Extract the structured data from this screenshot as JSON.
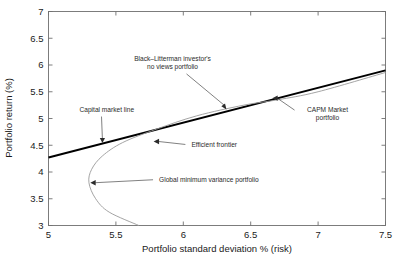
{
  "chart_data": {
    "type": "line",
    "title": "",
    "xlabel": "Portfolio standard deviation % (risk)",
    "ylabel": "Portfolio return (%)",
    "xlim": [
      5,
      7.5
    ],
    "ylim": [
      3,
      7
    ],
    "grid": false,
    "legend": "none",
    "xticks": [
      "5",
      "5.5",
      "6",
      "6.5",
      "7",
      "7.5"
    ],
    "xtick_values": [
      5,
      5.5,
      6,
      6.5,
      7,
      7.5
    ],
    "yticks": [
      "3",
      "3.5",
      "4",
      "4.5",
      "5",
      "5.5",
      "6",
      "6.5",
      "7"
    ],
    "ytick_values": [
      3,
      3.5,
      4,
      4.5,
      5,
      5.5,
      6,
      6.5,
      7
    ],
    "series": [
      {
        "name": "Capital market line",
        "style": "thick-black-straight",
        "color": "#000000",
        "x": [
          5.0,
          7.5
        ],
        "y": [
          4.27,
          5.9
        ]
      },
      {
        "name": "Efficient frontier",
        "style": "thin-gray-hyperbola",
        "color": "#9a9a9a",
        "x": [
          5.67,
          5.45,
          5.35,
          5.3,
          5.32,
          5.4,
          5.55,
          5.8,
          6.1,
          6.45,
          6.7,
          7.0,
          7.5
        ],
        "y": [
          3.0,
          3.25,
          3.5,
          3.8,
          4.05,
          4.3,
          4.55,
          4.8,
          5.05,
          5.25,
          5.35,
          5.5,
          5.86
        ]
      }
    ],
    "annotations": [
      {
        "name": "capital-market-line",
        "lines": [
          "Capital market line"
        ],
        "text_x": 5.23,
        "text_y": 5.13,
        "point_x": 5.4,
        "point_y": 4.54,
        "arrow": "down"
      },
      {
        "name": "black-litterman-no-views-portfolio",
        "lines": [
          "Black–Litterman investor's",
          "no views portfolio"
        ],
        "text_x": 5.92,
        "text_y": 6.08,
        "point_x": 6.32,
        "point_y": 5.17,
        "arrow": "down-right"
      },
      {
        "name": "capm-market-portfolio",
        "lines": [
          "CAPM Market",
          "portfolio"
        ],
        "text_x": 7.07,
        "text_y": 5.12,
        "point_x": 6.66,
        "point_y": 5.38,
        "arrow": "left"
      },
      {
        "name": "efficient-frontier",
        "lines": [
          "Efficient frontier"
        ],
        "text_x": 6.06,
        "text_y": 4.47,
        "point_x": 5.78,
        "point_y": 4.57,
        "arrow": "left"
      },
      {
        "name": "global-minimum-variance-portfolio",
        "lines": [
          "Global minimum variance portfolio"
        ],
        "text_x": 5.82,
        "text_y": 3.81,
        "point_x": 5.31,
        "point_y": 3.8,
        "arrow": "left"
      }
    ],
    "colors": {
      "cml": "#000000",
      "frontier": "#9a9a9a",
      "frame": "#6f6f6f",
      "text": "#1a1a1a",
      "annotation_text": "#2b2b2b",
      "background": "#ffffff"
    }
  }
}
